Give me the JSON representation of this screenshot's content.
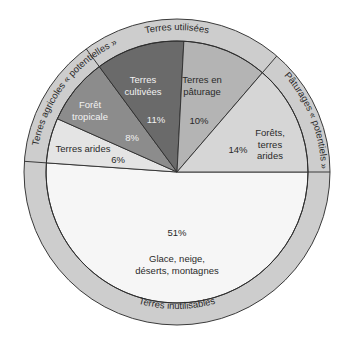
{
  "chart_data": {
    "type": "pie",
    "title": "",
    "center": [
      177,
      172
    ],
    "inner_radius": 131,
    "outer_radius": 153,
    "slices": [
      {
        "id": "glace",
        "label_lines": [
          "Glace, neige,",
          "déserts, montagnes"
        ],
        "value": 51,
        "pct_label": "51%",
        "color": "#f6f6f6",
        "start_deg": 0,
        "end_deg": 184,
        "group": "Terres inutilisables"
      },
      {
        "id": "arides",
        "label_lines": [
          "Terres arides"
        ],
        "value": 6,
        "pct_label": "6%",
        "color": "#e4e4e4",
        "start_deg": 184,
        "end_deg": 204,
        "group": "Terres agricoles « potentielles »"
      },
      {
        "id": "foret",
        "label_lines": [
          "Forêt",
          "tropicale"
        ],
        "value": 8,
        "pct_label": "8%",
        "color": "#8c8c8c",
        "start_deg": 204,
        "end_deg": 233.6,
        "group": "Terres agricoles « potentielles »"
      },
      {
        "id": "cultivees",
        "label_lines": [
          "Terres",
          "cultivées"
        ],
        "value": 11,
        "pct_label": "11%",
        "color": "#6a6a6a",
        "start_deg": 233.6,
        "end_deg": 273,
        "group": "Terres utilisées"
      },
      {
        "id": "paturage",
        "label_lines": [
          "Terres en",
          "pâturage"
        ],
        "value": 10,
        "pct_label": "10%",
        "color": "#b4b4b4",
        "start_deg": 273,
        "end_deg": 310.7,
        "group": "Terres utilisées"
      },
      {
        "id": "forets_arides",
        "label_lines": [
          "Forêts,",
          "terres",
          "arides"
        ],
        "value": 14,
        "pct_label": "14%",
        "color": "#d6d6d6",
        "start_deg": 310.7,
        "end_deg": 360,
        "group": "Pâturages « potentiels »"
      }
    ],
    "outer_ring": {
      "color": "#cdcdcd",
      "groups": [
        {
          "label": "Terres utilisées",
          "start_deg": 233.6,
          "end_deg": 310.7
        },
        {
          "label": "Pâturages « potentiels »",
          "start_deg": 310.7,
          "end_deg": 360
        },
        {
          "label": "Terres inutilisables",
          "start_deg": 0,
          "end_deg": 184
        },
        {
          "label": "Terres agricoles « potentielles »",
          "start_deg": 184,
          "end_deg": 233.6
        }
      ]
    },
    "legend": "none",
    "grid": false
  }
}
